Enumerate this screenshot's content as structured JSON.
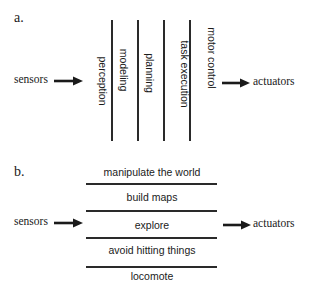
{
  "panel_a": {
    "label": "a.",
    "input": "sensors",
    "output": "actuators",
    "layers": [
      "perception",
      "modeling",
      "planning",
      "task execution",
      "motor control"
    ]
  },
  "panel_b": {
    "label": "b.",
    "input": "sensors",
    "output": "actuators",
    "layers": [
      "manipulate the world",
      "build maps",
      "explore",
      "avoid hitting things",
      "locomote"
    ]
  },
  "colors": {
    "ink": "#1a1a1a",
    "line": "#2a2a2a",
    "background": "#ffffff"
  }
}
